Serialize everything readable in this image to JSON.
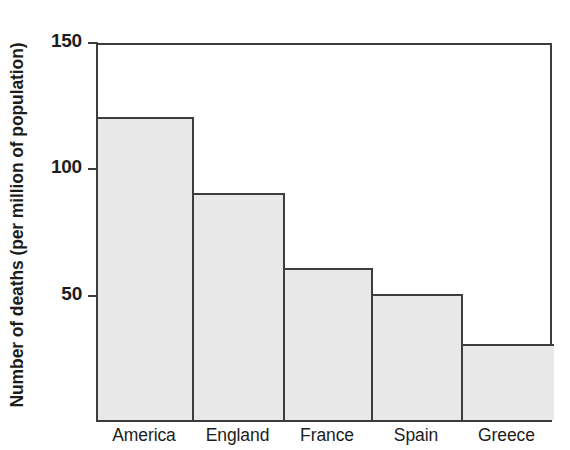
{
  "chart_data": {
    "type": "bar",
    "title": "",
    "subtitle": "",
    "xlabel": "",
    "ylabel": "Number of deaths (per million of population)",
    "categories": [
      "America",
      "England",
      "France",
      "Spain",
      "Greece"
    ],
    "values": [
      120,
      90,
      60,
      50,
      30
    ],
    "series": [
      {
        "name": "Number of deaths",
        "values": [
          120,
          90,
          60,
          50,
          30
        ]
      }
    ],
    "ylim": [
      0,
      150
    ],
    "y_ticks": [
      50,
      100,
      150
    ],
    "y_tick_labels": [
      "50",
      "100",
      "150"
    ],
    "grid": false,
    "legend": false,
    "legend_position": "none",
    "annotations": [],
    "colors": {
      "bar_fill": "#e8e8e8",
      "bar_stroke": "#3d3d3d",
      "axis": "#3d3d3d",
      "text": "#1c1c1c",
      "background": "#ffffff"
    }
  },
  "axis": {
    "y_title": "Number of deaths (per million of population)",
    "ticks": [
      {
        "label": "150",
        "value": 150
      },
      {
        "label": "100",
        "value": 100
      },
      {
        "label": "50",
        "value": 50
      }
    ]
  },
  "bars": [
    {
      "label": "America",
      "value": 120
    },
    {
      "label": "England",
      "value": 90
    },
    {
      "label": "France",
      "value": 60
    },
    {
      "label": "Spain",
      "value": 50
    },
    {
      "label": "Greece",
      "value": 30
    }
  ]
}
